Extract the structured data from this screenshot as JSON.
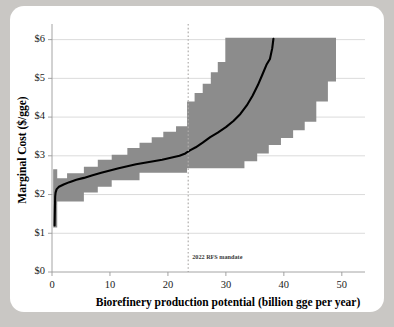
{
  "chart_data": {
    "type": "area",
    "title": "",
    "xlabel": "Biorefinery production potential (billion gge per year)",
    "ylabel": "Marginal Cost ($/gge)",
    "xlim": [
      0,
      54
    ],
    "ylim": [
      0,
      6.3
    ],
    "xticks": [
      0,
      10,
      20,
      30,
      40,
      50
    ],
    "xtick_labels": [
      "0",
      "10",
      "20",
      "30",
      "40",
      "50"
    ],
    "yticks": [
      0,
      1,
      2,
      3,
      4,
      5,
      6
    ],
    "ytick_labels": [
      "$0",
      "$1",
      "$2",
      "$3",
      "$4",
      "$5",
      "$6"
    ],
    "grid": true,
    "legend": null,
    "band_color": "#8c8c8c",
    "line_color": "#000000",
    "annotations": [
      {
        "name": "2022-rfs-mandate",
        "label": "2022 RFS mandate",
        "x": 23.5,
        "style": "vertical-dotted-line",
        "color": "#b0aeac"
      }
    ],
    "series": [
      {
        "name": "Marginal cost range (shaded band)",
        "kind": "step-band",
        "upper_steps": [
          {
            "x0": 0.2,
            "x1": 0.9,
            "y": 2.65
          },
          {
            "x0": 0.9,
            "x1": 2.6,
            "y": 2.42
          },
          {
            "x0": 2.6,
            "x1": 5.5,
            "y": 2.55
          },
          {
            "x0": 5.5,
            "x1": 7.9,
            "y": 2.72
          },
          {
            "x0": 7.9,
            "x1": 10.3,
            "y": 2.9
          },
          {
            "x0": 10.3,
            "x1": 13.0,
            "y": 3.03
          },
          {
            "x0": 13.0,
            "x1": 15.1,
            "y": 3.2
          },
          {
            "x0": 15.1,
            "x1": 17.2,
            "y": 3.34
          },
          {
            "x0": 17.2,
            "x1": 19.2,
            "y": 3.48
          },
          {
            "x0": 19.2,
            "x1": 21.4,
            "y": 3.62
          },
          {
            "x0": 21.4,
            "x1": 23.3,
            "y": 3.76
          },
          {
            "x0": 23.3,
            "x1": 24.6,
            "y": 4.4
          },
          {
            "x0": 24.6,
            "x1": 26.0,
            "y": 4.62
          },
          {
            "x0": 26.0,
            "x1": 27.4,
            "y": 4.86
          },
          {
            "x0": 27.4,
            "x1": 28.6,
            "y": 5.16
          },
          {
            "x0": 28.6,
            "x1": 29.9,
            "y": 5.42
          },
          {
            "x0": 29.9,
            "x1": 50.2,
            "y": 6.05
          }
        ],
        "lower_steps": [
          {
            "x0": 0.2,
            "x1": 0.9,
            "y": 1.15
          },
          {
            "x0": 0.9,
            "x1": 2.6,
            "y": 1.82
          },
          {
            "x0": 2.6,
            "x1": 5.5,
            "y": 1.82
          },
          {
            "x0": 5.5,
            "x1": 7.9,
            "y": 2.05
          },
          {
            "x0": 7.9,
            "x1": 10.3,
            "y": 2.2
          },
          {
            "x0": 10.3,
            "x1": 13.0,
            "y": 2.37
          },
          {
            "x0": 13.0,
            "x1": 15.1,
            "y": 2.37
          },
          {
            "x0": 15.1,
            "x1": 21.4,
            "y": 2.56
          },
          {
            "x0": 21.4,
            "x1": 23.3,
            "y": 2.56
          },
          {
            "x0": 23.3,
            "x1": 30.8,
            "y": 2.68
          },
          {
            "x0": 30.8,
            "x1": 33.2,
            "y": 2.68
          },
          {
            "x0": 33.2,
            "x1": 35.4,
            "y": 2.86
          },
          {
            "x0": 35.4,
            "x1": 37.4,
            "y": 3.06
          },
          {
            "x0": 37.4,
            "x1": 39.5,
            "y": 3.28
          },
          {
            "x0": 39.5,
            "x1": 41.6,
            "y": 3.46
          },
          {
            "x0": 41.6,
            "x1": 43.6,
            "y": 3.66
          },
          {
            "x0": 43.6,
            "x1": 45.6,
            "y": 3.88
          },
          {
            "x0": 45.6,
            "x1": 47.6,
            "y": 4.4
          },
          {
            "x0": 47.6,
            "x1": 49.0,
            "y": 4.92
          },
          {
            "x0": 49.0,
            "x1": 50.2,
            "y": 6.05
          }
        ]
      },
      {
        "name": "Marginal cost (median curve)",
        "kind": "line",
        "points": [
          [
            0.45,
            1.2
          ],
          [
            0.5,
            1.62
          ],
          [
            0.55,
            1.95
          ],
          [
            0.62,
            2.05
          ],
          [
            0.8,
            2.14
          ],
          [
            1.2,
            2.2
          ],
          [
            2.0,
            2.26
          ],
          [
            3.0,
            2.32
          ],
          [
            4.2,
            2.38
          ],
          [
            5.5,
            2.43
          ],
          [
            7.0,
            2.5
          ],
          [
            8.5,
            2.56
          ],
          [
            10.0,
            2.62
          ],
          [
            11.5,
            2.68
          ],
          [
            13.0,
            2.73
          ],
          [
            14.5,
            2.78
          ],
          [
            16.0,
            2.82
          ],
          [
            17.5,
            2.86
          ],
          [
            19.0,
            2.9
          ],
          [
            20.5,
            2.95
          ],
          [
            22.0,
            3.0
          ],
          [
            23.0,
            3.06
          ],
          [
            23.8,
            3.14
          ],
          [
            24.8,
            3.22
          ],
          [
            26.0,
            3.34
          ],
          [
            27.3,
            3.48
          ],
          [
            28.6,
            3.6
          ],
          [
            30.0,
            3.74
          ],
          [
            31.3,
            3.9
          ],
          [
            32.5,
            4.08
          ],
          [
            33.6,
            4.3
          ],
          [
            34.6,
            4.55
          ],
          [
            35.5,
            4.82
          ],
          [
            36.3,
            5.1
          ],
          [
            37.0,
            5.35
          ],
          [
            37.6,
            5.5
          ],
          [
            38.0,
            5.78
          ],
          [
            38.2,
            6.02
          ]
        ]
      }
    ]
  },
  "axes": {
    "y_title": "Marginal Cost ($/gge)",
    "x_title": "Biorefinery production potential (billion gge per year)"
  }
}
